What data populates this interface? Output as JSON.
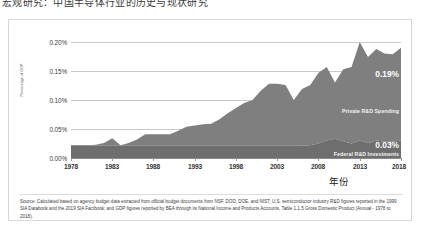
{
  "top_caption": "宏观研究：中国半导体行业的历史与现状研究",
  "chart_data": {
    "type": "area",
    "stacked": true,
    "title": "",
    "xlabel": "年份",
    "ylabel": "Percentage of GDP",
    "grid": true,
    "legend_position": "inline-annotation",
    "xlim": [
      1978,
      2018
    ],
    "ylim": [
      0.0,
      0.2
    ],
    "y_ticks": [
      "0.00%",
      "0.05%",
      "0.10%",
      "0.15%",
      "0.20%"
    ],
    "y_tick_values": [
      0.0,
      0.05,
      0.1,
      0.15,
      0.2
    ],
    "x_ticks": [
      "1978",
      "1983",
      "1988",
      "1993",
      "1998",
      "2003",
      "2008",
      "2013",
      "2018"
    ],
    "x_tick_values": [
      1978,
      1983,
      1988,
      1993,
      1998,
      2003,
      2008,
      2013,
      2018
    ],
    "x": [
      1978,
      1979,
      1980,
      1981,
      1982,
      1983,
      1984,
      1985,
      1986,
      1987,
      1988,
      1989,
      1990,
      1991,
      1992,
      1993,
      1994,
      1995,
      1996,
      1997,
      1998,
      1999,
      2000,
      2001,
      2002,
      2003,
      2004,
      2005,
      2006,
      2007,
      2008,
      2009,
      2010,
      2011,
      2012,
      2013,
      2014,
      2015,
      2016,
      2017,
      2018
    ],
    "series": [
      {
        "name": "Federal R&D Investments",
        "color": "#6e6e6e",
        "end_label": "0.03%",
        "values": [
          0.022,
          0.022,
          0.022,
          0.021,
          0.021,
          0.021,
          0.021,
          0.021,
          0.021,
          0.021,
          0.021,
          0.021,
          0.021,
          0.021,
          0.021,
          0.021,
          0.021,
          0.021,
          0.021,
          0.021,
          0.021,
          0.021,
          0.021,
          0.021,
          0.021,
          0.021,
          0.021,
          0.021,
          0.021,
          0.022,
          0.025,
          0.03,
          0.033,
          0.029,
          0.025,
          0.03,
          0.026,
          0.03,
          0.028,
          0.028,
          0.03
        ]
      },
      {
        "name": "Private R&D Spending",
        "color": "#7f7f7f",
        "end_label": "0.19%",
        "values": [
          0.0,
          0.0,
          0.0,
          0.002,
          0.005,
          0.013,
          0.001,
          0.005,
          0.011,
          0.02,
          0.02,
          0.02,
          0.02,
          0.026,
          0.033,
          0.035,
          0.037,
          0.038,
          0.046,
          0.056,
          0.065,
          0.074,
          0.079,
          0.095,
          0.107,
          0.107,
          0.105,
          0.079,
          0.098,
          0.104,
          0.122,
          0.127,
          0.097,
          0.124,
          0.132,
          0.17,
          0.148,
          0.158,
          0.152,
          0.151,
          0.16
        ]
      }
    ],
    "totals": [
      0.022,
      0.022,
      0.022,
      0.023,
      0.026,
      0.034,
      0.022,
      0.026,
      0.032,
      0.041,
      0.041,
      0.041,
      0.041,
      0.047,
      0.054,
      0.056,
      0.058,
      0.059,
      0.067,
      0.077,
      0.086,
      0.095,
      0.1,
      0.116,
      0.128,
      0.128,
      0.126,
      0.1,
      0.119,
      0.126,
      0.147,
      0.157,
      0.13,
      0.153,
      0.157,
      0.2,
      0.174,
      0.188,
      0.18,
      0.179,
      0.19
    ],
    "annotations": [
      {
        "text": "Private R&D Spending",
        "kind": "series-label"
      },
      {
        "text": "Federal R&D Investments",
        "kind": "series-label"
      },
      {
        "text": "0.19%",
        "kind": "value-label"
      },
      {
        "text": "0.03%",
        "kind": "value-label"
      }
    ]
  },
  "source_note": "Source: Calculated based on agency budget data extracted from official budget documents from NSF, DOD, DOE, and NIST; U.S. semiconductor industry R&D figures reported in the 1999 SIA Databook and the 2019 SIA Factbook; and GDP figures reported by BEA through its National Income and Products Accounts, Table 1.1.5 Gross Domestic Product (Annual - 1978 to 2018)."
}
